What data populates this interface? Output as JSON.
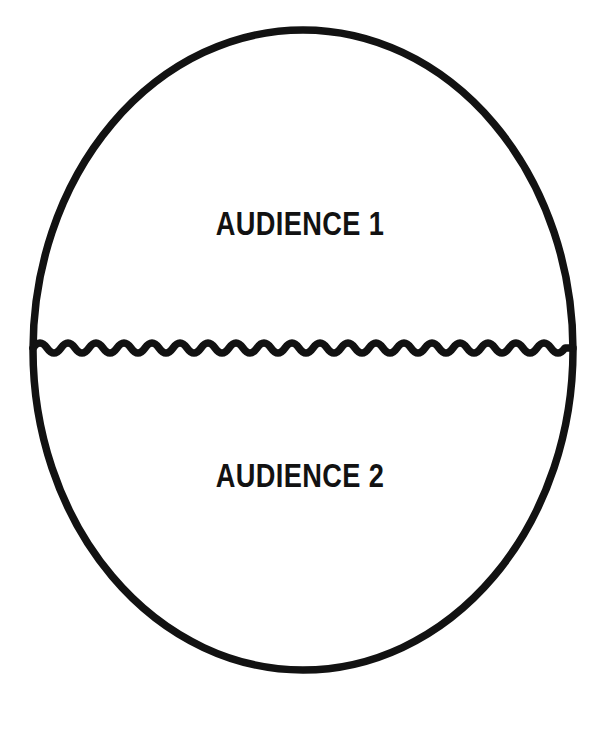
{
  "diagram": {
    "type": "split-oval-venn",
    "background_color": "#ffffff",
    "ink_color": "#121212",
    "shape": {
      "name": "oval-outline",
      "kind": "ellipse",
      "center_x": 303,
      "center_y": 350,
      "radius_x": 270,
      "radius_y": 320,
      "stroke_width": 7.5,
      "stroke_color": "#121212",
      "fill": "none"
    },
    "divider": {
      "name": "wavy-divider",
      "kind": "wave",
      "y": 348,
      "x_start": 33,
      "x_end": 573,
      "wavelength": 28,
      "amplitude": 5,
      "cycles": 19,
      "stroke_width": 7.5,
      "stroke_color": "#121212"
    },
    "regions": [
      {
        "id": "audience-1",
        "label": "AUDIENCE 1",
        "position": "top",
        "label_x": 303,
        "label_y": 223
      },
      {
        "id": "audience-2",
        "label": "AUDIENCE 2",
        "position": "bottom",
        "label_x": 303,
        "label_y": 475
      }
    ]
  }
}
